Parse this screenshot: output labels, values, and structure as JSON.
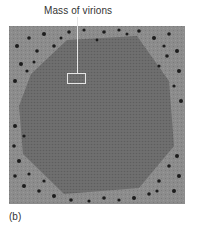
{
  "figure": {
    "callout_label": "Mass of virions",
    "panel_label": "(b)",
    "image": {
      "description": "Electron micrograph of a hexagonal crystalline mass of virions surrounded by scattered dark particles",
      "background_color": "#8a8a8a",
      "mass_color": "#6e6e6e",
      "particle_color": "#1a1a1a"
    }
  }
}
